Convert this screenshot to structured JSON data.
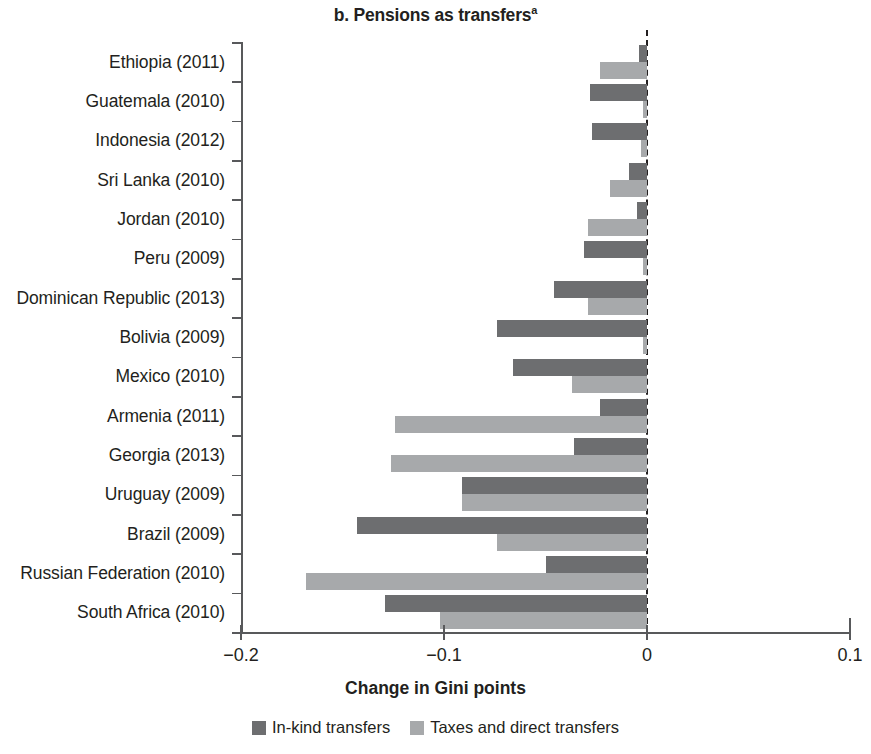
{
  "title": {
    "text": "b. Pensions as transfers",
    "footnote_marker": "a"
  },
  "axis": {
    "x_title": "Change in Gini points",
    "x_ticklabels": [
      "−0.2",
      "−0.1",
      "0",
      "0.1"
    ],
    "x_tickvalues": [
      -0.2,
      -0.1,
      0,
      0.1
    ]
  },
  "legend": {
    "entries": [
      {
        "label": "In-kind transfers",
        "color": "#6d6e70"
      },
      {
        "label": "Taxes and direct transfers",
        "color": "#a7a9ab"
      }
    ]
  },
  "colors": {
    "in_kind": "#6d6e70",
    "taxes_direct": "#a7a9ab",
    "axis": "#58595b",
    "text": "#231f20"
  },
  "chart_data": {
    "type": "bar",
    "orientation": "horizontal",
    "title": "b. Pensions as transfers",
    "xlabel": "Change in Gini points",
    "ylabel": "",
    "xlim": [
      -0.2,
      0.1
    ],
    "xticks": [
      -0.2,
      -0.1,
      0,
      0.1
    ],
    "grid": false,
    "legend_position": "bottom",
    "zero_reference_line": 0,
    "categories": [
      "Ethiopia (2011)",
      "Guatemala (2010)",
      "Indonesia (2012)",
      "Sri Lanka (2010)",
      "Jordan (2010)",
      "Peru (2009)",
      "Dominican Republic (2013)",
      "Bolivia (2009)",
      "Mexico (2010)",
      "Armenia (2011)",
      "Georgia (2013)",
      "Uruguay (2009)",
      "Brazil (2009)",
      "Russian Federation (2010)",
      "South Africa (2010)"
    ],
    "series": [
      {
        "name": "In-kind transfers",
        "color": "#6d6e70",
        "values": [
          -0.004,
          -0.028,
          -0.027,
          -0.009,
          -0.005,
          -0.031,
          -0.046,
          -0.074,
          -0.066,
          -0.023,
          -0.036,
          -0.091,
          -0.143,
          -0.05,
          -0.129
        ]
      },
      {
        "name": "Taxes and direct transfers",
        "color": "#a7a9ab",
        "values": [
          -0.023,
          -0.002,
          -0.003,
          -0.018,
          -0.029,
          -0.002,
          -0.029,
          -0.002,
          -0.037,
          -0.124,
          -0.126,
          -0.091,
          -0.074,
          -0.168,
          -0.102
        ]
      }
    ]
  }
}
